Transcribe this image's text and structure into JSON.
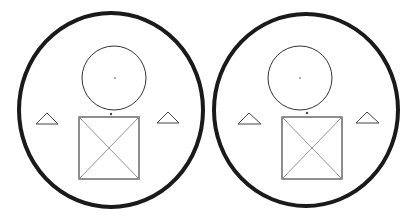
{
  "figures": [
    {
      "name": "left-figure",
      "outer_ellipse": {
        "cx": 111,
        "cy": 110,
        "rx": 92,
        "ry": 97
      },
      "inner_circle": {
        "cx": 114,
        "cy": 78,
        "r": 32
      },
      "center_dot": {
        "cx": 115,
        "cy": 78
      },
      "top_dot": {
        "cx": 111,
        "cy": 114
      },
      "square": {
        "x": 79,
        "y": 117,
        "w": 60,
        "h": 62
      },
      "triangle_left": "36,124 47,113 58,124",
      "triangle_right": "157,123 168,112 179,123"
    },
    {
      "name": "right-figure",
      "outer_ellipse": {
        "cx": 306,
        "cy": 110,
        "rx": 92,
        "ry": 96
      },
      "inner_circle": {
        "cx": 300,
        "cy": 78,
        "r": 32
      },
      "center_dot": {
        "cx": 300,
        "cy": 78
      },
      "top_dot": {
        "cx": 307,
        "cy": 113
      },
      "square": {
        "x": 282,
        "y": 117,
        "w": 60,
        "h": 62
      },
      "triangle_left": "238,124 249,113 261,124",
      "triangle_right": "356,123 367,112 379,123"
    }
  ],
  "colors": {
    "outer_stroke": "#1a1a1a",
    "line_stroke": "#444444",
    "diagonal_stroke": "#888888",
    "background": "#ffffff"
  }
}
